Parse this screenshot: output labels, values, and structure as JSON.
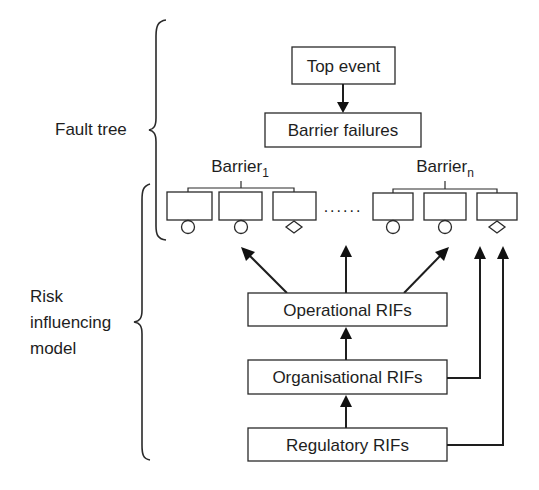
{
  "diagram": {
    "colors": {
      "background": "#ffffff",
      "stroke": "#1e1e1e",
      "text": "#1e1e1e"
    },
    "side_labels": {
      "fault_tree": "Fault tree",
      "risk_model": [
        "Risk",
        "influencing",
        "model"
      ]
    },
    "nodes": {
      "top_event": "Top event",
      "barrier_failures": "Barrier failures",
      "operational": "Operational RIFs",
      "organisational": "Organisational RIFs",
      "regulatory": "Regulatory RIFs"
    },
    "barriers": [
      {
        "label": "Barrier",
        "subscript": "1",
        "events": [
          "circle",
          "circle",
          "diamond"
        ]
      },
      {
        "label": "Barrier",
        "subscript": "n",
        "events": [
          "circle",
          "circle",
          "diamond"
        ]
      }
    ],
    "ellipsis": "......",
    "edges": [
      {
        "from": "top_event",
        "to": "barrier_failures"
      },
      {
        "from": "operational",
        "to": "barrier_1_event_2"
      },
      {
        "from": "operational",
        "to": "ellipsis"
      },
      {
        "from": "operational",
        "to": "barrier_n_event_2"
      },
      {
        "from": "organisational",
        "to": "operational"
      },
      {
        "from": "organisational",
        "to": "barrier_n_event_3"
      },
      {
        "from": "regulatory",
        "to": "organisational"
      },
      {
        "from": "regulatory",
        "to": "barrier_n_event_3"
      }
    ]
  }
}
